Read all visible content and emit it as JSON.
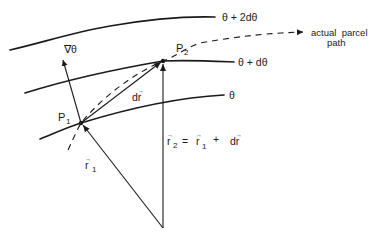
{
  "diagram": {
    "isentropes": [
      {
        "label": "θ + 2dθ"
      },
      {
        "label": "θ + dθ"
      },
      {
        "label": "θ"
      }
    ],
    "points": {
      "p1": {
        "label": "P",
        "subscript": "1"
      },
      "p2": {
        "label": "P",
        "subscript": "2"
      }
    },
    "vectors": {
      "gradient": {
        "label": "∇θ"
      },
      "displacement": {
        "label": "dr",
        "arrow": "→"
      },
      "r1": {
        "label": "r",
        "subscript": "1",
        "arrow": "→"
      },
      "r2_equation": {
        "lhs": "r",
        "lhs_sub": "2",
        "eq": "=",
        "rhs1": "r",
        "rhs1_sub": "1",
        "plus": "+",
        "rhs2": "dr",
        "arrow": "→"
      }
    },
    "parcel_path": {
      "label_line1": "actual  parcel",
      "label_line2": "path"
    },
    "colors": {
      "ink": "#1a1a1a",
      "background": "#ffffff"
    }
  }
}
